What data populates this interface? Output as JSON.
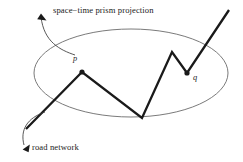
{
  "figure": {
    "background_color": "#ffffff",
    "stroke_color": "#1a1a1a",
    "ellipse_stroke_color": "#6b6b6b",
    "annotations": {
      "prism_label": "space−time prism projection",
      "road_label": "road network",
      "point_p": "p",
      "point_q": "q"
    },
    "ellipse": {
      "name": "space-time prism projection",
      "cx": 131,
      "cy": 73,
      "rx": 97,
      "ry": 44
    },
    "road_network_path": {
      "name": "road network polyline",
      "points": [
        [
          26,
          129
        ],
        [
          82,
          72
        ],
        [
          142,
          118
        ],
        [
          172,
          52
        ],
        [
          187,
          73
        ],
        [
          229,
          10
        ]
      ]
    },
    "vertex_markers": [
      {
        "label": "p",
        "x": 82,
        "y": 72
      },
      {
        "label": "q",
        "x": 187,
        "y": 73
      }
    ],
    "leader_arrows": [
      {
        "name": "prism-leader",
        "path": "M 75,55 C 60,50 44,42 41,17",
        "arrow_tip": [
          41,
          14
        ],
        "arrow_direction": "up-left"
      },
      {
        "name": "road-leader",
        "path": "M 45,112 C 27,118 20,130 24,145",
        "arrow_tip": [
          25,
          148
        ],
        "arrow_direction": "down-left"
      }
    ]
  }
}
